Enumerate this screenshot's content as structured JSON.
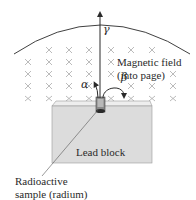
{
  "diagram": {
    "labels": {
      "gamma": "γ",
      "alpha": "α",
      "beta": "β",
      "field_line1": "Magnetic field",
      "field_line2": "(into page)",
      "block": "Lead block",
      "sample_line1": "Radioactive",
      "sample_line2": "sample (radium)"
    },
    "field_symbol": "×",
    "colors": {
      "line": "#2a2a2a",
      "cross": "#a9a9a9",
      "block_front": "#dcdcdc",
      "block_top": "#eeeeee",
      "block_edge": "#9a9a9a",
      "sample": "#555555"
    },
    "rays": [
      {
        "name": "gamma",
        "direction": "straight up"
      },
      {
        "name": "alpha",
        "direction": "curves left"
      },
      {
        "name": "beta",
        "direction": "curves right (tight)"
      }
    ]
  }
}
